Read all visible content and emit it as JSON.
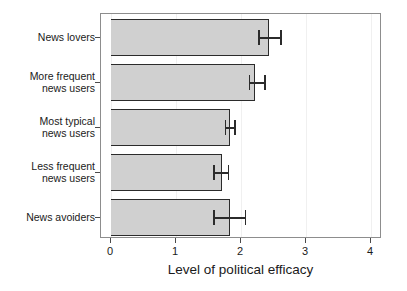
{
  "chart_data": {
    "type": "bar",
    "orientation": "horizontal",
    "title": "",
    "xlabel": "Level of political efficacy",
    "ylabel": "",
    "xlim": [
      0,
      4
    ],
    "xticks": [
      0,
      1,
      2,
      3,
      4
    ],
    "xtick_labels": [
      "0",
      "1",
      "2",
      "3",
      "4"
    ],
    "grid": true,
    "legend": null,
    "bar_color": "#d0d0d0",
    "bar_edge_color": "#2b2b2b",
    "error_bar_color": "#2b2b2b",
    "categories": [
      "News lovers",
      "More frequent\nnews users",
      "Most typical\nnews users",
      "Less frequent\nnews users",
      "News avoiders"
    ],
    "values": [
      2.43,
      2.22,
      1.83,
      1.7,
      1.83
    ],
    "error_low": [
      2.26,
      2.12,
      1.75,
      1.57,
      1.57
    ],
    "error_high": [
      2.63,
      2.38,
      1.92,
      1.82,
      2.08
    ],
    "bars": [
      {
        "category": "News lovers",
        "value": 2.43,
        "ci_low": 2.26,
        "ci_high": 2.63
      },
      {
        "category": "More frequent\nnews users",
        "value": 2.22,
        "ci_low": 2.12,
        "ci_high": 2.38
      },
      {
        "category": "Most typical\nnews users",
        "value": 1.83,
        "ci_low": 1.75,
        "ci_high": 1.92
      },
      {
        "category": "Less frequent\nnews users",
        "value": 1.7,
        "ci_low": 1.57,
        "ci_high": 1.82
      },
      {
        "category": "News avoiders",
        "value": 1.83,
        "ci_low": 1.57,
        "ci_high": 2.08
      }
    ]
  }
}
